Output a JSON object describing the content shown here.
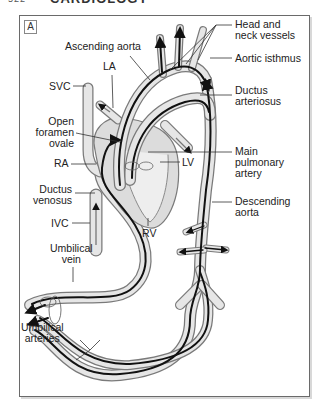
{
  "page": {
    "number": "522",
    "section": "CARDIOLOGY"
  },
  "figure": {
    "panel_label": "A",
    "labels": {
      "head_neck_1": "Head and",
      "head_neck_2": "neck vessels",
      "ascending_aorta": "Ascending aorta",
      "aortic_isthmus": "Aortic isthmus",
      "la": "LA",
      "svc": "SVC",
      "ductus_arteriosus_1": "Ductus",
      "ductus_arteriosus_2": "arteriosus",
      "open_foramen_1": "Open",
      "open_foramen_2": "foramen",
      "open_foramen_3": "ovale",
      "ra": "RA",
      "lv": "LV",
      "main_pulm_1": "Main",
      "main_pulm_2": "pulmonary",
      "main_pulm_3": "artery",
      "ductus_venosus_1": "Ductus",
      "ductus_venosus_2": "venosus",
      "rv": "RV",
      "descending_aorta_1": "Descending",
      "descending_aorta_2": "aorta",
      "ivc": "IVC",
      "umbilical_vein_1": "Umbilical",
      "umbilical_vein_2": "vein",
      "umbilical_arteries_1": "Umbilical",
      "umbilical_arteries_2": "arteries"
    },
    "colors": {
      "vessel_fill": "#e6e6e6",
      "vessel_outline": "#7a7a7a",
      "flow_line": "#111111",
      "leader_line": "#333333",
      "frame": "#6a6a6a"
    }
  }
}
